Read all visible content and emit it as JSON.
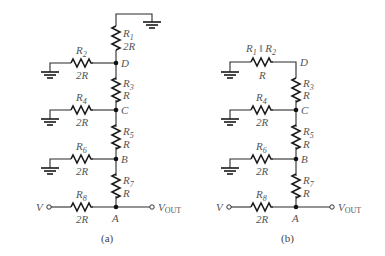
{
  "figure": {
    "panels": [
      {
        "id": "a",
        "caption": "(a)",
        "nodes": [
          "D",
          "C",
          "B",
          "A"
        ],
        "series_resistors": [
          {
            "name": "R",
            "sub": "1",
            "value": "2R"
          },
          {
            "name": "R",
            "sub": "3",
            "value": "R"
          },
          {
            "name": "R",
            "sub": "5",
            "value": "R"
          },
          {
            "name": "R",
            "sub": "7",
            "value": "R"
          }
        ],
        "shunt_resistors": [
          {
            "name": "R",
            "sub": "2",
            "value": "2R"
          },
          {
            "name": "R",
            "sub": "4",
            "value": "2R"
          },
          {
            "name": "R",
            "sub": "6",
            "value": "2R"
          },
          {
            "name": "R",
            "sub": "8",
            "value": "2R"
          }
        ],
        "input_label": "V",
        "output_label": "V",
        "output_sub": "OUT"
      },
      {
        "id": "b",
        "caption": "(b)",
        "nodes": [
          "D",
          "C",
          "B",
          "A"
        ],
        "combined": {
          "name1": "R",
          "sub1": "1",
          "sep": " ‖ ",
          "name2": "R",
          "sub2": "2",
          "value": "R"
        },
        "series_resistors": [
          {
            "name": "R",
            "sub": "3",
            "value": "R"
          },
          {
            "name": "R",
            "sub": "5",
            "value": "R"
          },
          {
            "name": "R",
            "sub": "7",
            "value": "R"
          }
        ],
        "shunt_resistors": [
          {
            "name": "R",
            "sub": "4",
            "value": "2R"
          },
          {
            "name": "R",
            "sub": "6",
            "value": "2R"
          },
          {
            "name": "R",
            "sub": "8",
            "value": "2R"
          }
        ],
        "input_label": "V",
        "output_label": "V",
        "output_sub": "OUT"
      }
    ]
  }
}
